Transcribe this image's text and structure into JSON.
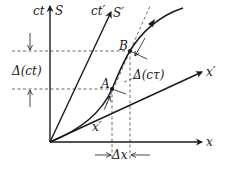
{
  "diagram": {
    "axes": {
      "x": {
        "label": "x"
      },
      "ct": {
        "label": "ct"
      },
      "S": {
        "label": "S"
      },
      "ct_prime": {
        "label": "ct′"
      },
      "S_prime": {
        "label": "S′"
      },
      "x_prime": {
        "label": "x′"
      }
    },
    "points": {
      "A": {
        "label": "A"
      },
      "B": {
        "label": "B"
      }
    },
    "annotations": {
      "delta_ct": "Δ(ct)",
      "delta_ctau": "Δ(cτ)",
      "delta_x": "Δx",
      "x_prime_inner": "x′"
    },
    "colors": {
      "ink": "#1a1a1a",
      "background": "#ffffff"
    }
  }
}
